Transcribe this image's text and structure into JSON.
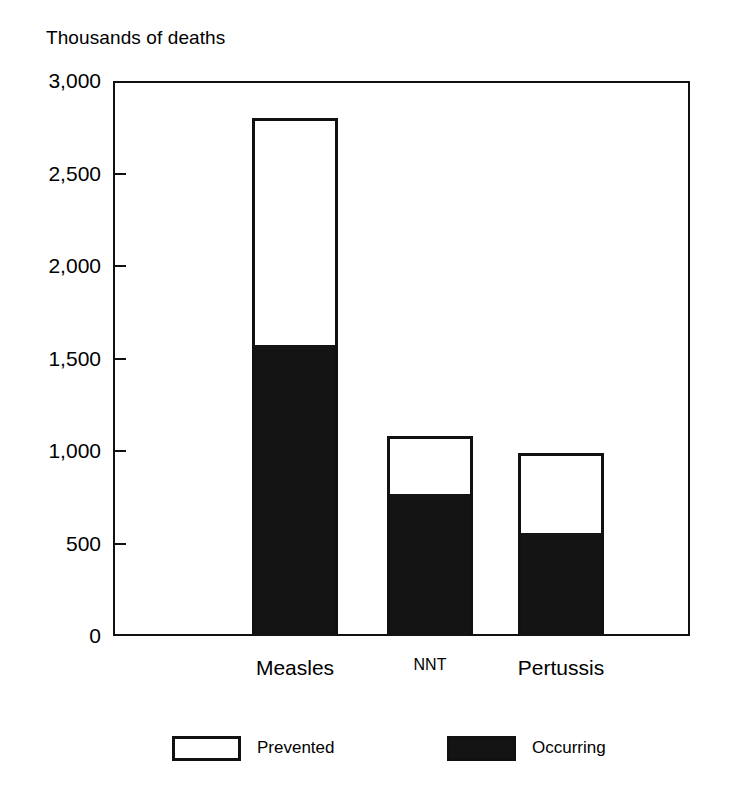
{
  "chart_data": {
    "type": "bar",
    "subtype": "stacked",
    "title": "",
    "ylabel": "Thousands of deaths",
    "xlabel": "",
    "categories": [
      "Measles",
      "NNT",
      "Pertussis"
    ],
    "series": [
      {
        "name": "Occurring",
        "values": [
          1575,
          770,
          555
        ],
        "color": "#141414"
      },
      {
        "name": "Prevented",
        "values": [
          1225,
          310,
          435
        ],
        "color": "#ffffff"
      }
    ],
    "totals": [
      2800,
      1080,
      990
    ],
    "ylim": [
      0,
      3000
    ],
    "ytick_values": [
      3000,
      2500,
      2000,
      1500,
      1000,
      500,
      0
    ],
    "ytick_labels": [
      "3,000",
      "2,500",
      "2,000",
      "1,500",
      "1,000",
      "500",
      "0"
    ],
    "grid": false,
    "legend_position": "bottom",
    "legend_entries": [
      "Prevented",
      "Occurring"
    ]
  },
  "axis": {
    "title": "Thousands of deaths",
    "ticks": [
      {
        "label": "3,000",
        "value": 3000
      },
      {
        "label": "2,500",
        "value": 2500
      },
      {
        "label": "2,000",
        "value": 2000
      },
      {
        "label": "1,500",
        "value": 1500
      },
      {
        "label": "1,000",
        "value": 1000
      },
      {
        "label": "500",
        "value": 500
      },
      {
        "label": "0",
        "value": 0
      }
    ]
  },
  "categories": [
    {
      "label": "Measles",
      "font_size": 21
    },
    {
      "label": "NNT",
      "font_size": 16
    },
    {
      "label": "Pertussis",
      "font_size": 21
    }
  ],
  "legend": {
    "items": [
      {
        "label": "Prevented",
        "style": "hollow"
      },
      {
        "label": "Occurring",
        "style": "filled"
      }
    ]
  },
  "colors": {
    "occurring": "#141414",
    "prevented": "#ffffff",
    "stroke": "#111111",
    "background": "#ffffff"
  }
}
